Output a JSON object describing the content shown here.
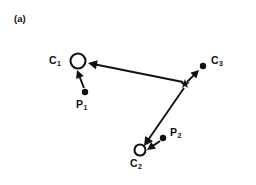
{
  "figure": {
    "panel_tag": "(a)",
    "background_color": "#ffffff",
    "stroke_color": "#111111",
    "width": 256,
    "height": 185
  },
  "labels": {
    "c1": {
      "base": "C",
      "sub": "1",
      "x": 49,
      "y": 55
    },
    "c2": {
      "base": "C",
      "sub": "2",
      "x": 130,
      "y": 158
    },
    "c3": {
      "base": "C",
      "sub": "3",
      "x": 211,
      "y": 55
    },
    "p1": {
      "base": "P",
      "sub": "1",
      "x": 76,
      "y": 99
    },
    "p2": {
      "base": "P",
      "sub": "2",
      "x": 170,
      "y": 127
    }
  },
  "markers": {
    "c1_circle": {
      "name": "open-circle",
      "cx": 78,
      "cy": 61,
      "r": 7.5,
      "filled": false
    },
    "c2_circle": {
      "name": "open-circle",
      "cx": 140,
      "cy": 150,
      "r": 5.5,
      "filled": false
    },
    "c3_dot": {
      "name": "filled-dot",
      "cx": 203,
      "cy": 66,
      "r": 3.2,
      "filled": true
    },
    "p1_dot": {
      "name": "filled-dot",
      "cx": 85,
      "cy": 92,
      "r": 3.2,
      "filled": true
    },
    "p2_dot": {
      "name": "filled-dot",
      "cx": 163,
      "cy": 138,
      "r": 3.2,
      "filled": true
    },
    "centroid_star": {
      "name": "star",
      "cx": 185,
      "cy": 84,
      "r": 5.0
    }
  },
  "arrows": [
    {
      "name": "star-to-c1",
      "x1": 183,
      "y1": 82,
      "x2": 88,
      "y2": 63,
      "head": 9
    },
    {
      "name": "p1-to-c1",
      "x1": 84,
      "y1": 88,
      "x2": 77,
      "y2": 70,
      "head": 8
    },
    {
      "name": "star-to-c3",
      "x1": 187,
      "y1": 82,
      "x2": 199,
      "y2": 70,
      "head": 8
    },
    {
      "name": "star-to-c2",
      "x1": 184,
      "y1": 88,
      "x2": 144,
      "y2": 146,
      "head": 9
    },
    {
      "name": "p2-to-c2",
      "x1": 160,
      "y1": 141,
      "x2": 147,
      "y2": 150,
      "head": 8
    }
  ],
  "description": {
    "type": "vector-field-diagram",
    "caption": "(a)"
  }
}
